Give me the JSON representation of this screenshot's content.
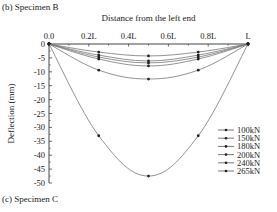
{
  "captions": {
    "top": "(b) Specimen B",
    "bottom": "(c) Specimen C"
  },
  "chart_data": {
    "type": "line",
    "title": "",
    "xlabel": "Distance from the left end",
    "ylabel": "Deflection (mm)",
    "x_tick_labels": [
      "0.0",
      "0.2L",
      "0.4L",
      "0.6L",
      "0.8L",
      "L"
    ],
    "x": [
      0,
      0.25,
      0.5,
      0.75,
      1.0
    ],
    "y_ticks": [
      0,
      -5,
      -10,
      -15,
      -20,
      -25,
      -30,
      -35,
      -40,
      -45,
      -50
    ],
    "ylim": [
      -50,
      0
    ],
    "xlim": [
      0,
      1
    ],
    "grid": false,
    "legend_position": "right",
    "series": [
      {
        "name": "100kN",
        "values": [
          0,
          -2.9,
          -4.3,
          -2.9,
          0
        ]
      },
      {
        "name": "150kN",
        "values": [
          0,
          -4.0,
          -6.1,
          -4.0,
          0
        ]
      },
      {
        "name": "180kN",
        "values": [
          0,
          -4.7,
          -6.8,
          -4.7,
          0
        ]
      },
      {
        "name": "200kN",
        "values": [
          0,
          -5.4,
          -7.9,
          -5.4,
          0
        ]
      },
      {
        "name": "240kN",
        "values": [
          0,
          -9.4,
          -12.6,
          -9.4,
          0
        ]
      },
      {
        "name": "265kN",
        "values": [
          0,
          -33.0,
          -47.5,
          -33.0,
          0
        ]
      }
    ]
  }
}
